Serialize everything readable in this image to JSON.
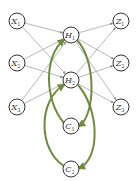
{
  "diagram": {
    "type": "neural-network-with-context-loops",
    "nodes": [
      {
        "id": "X1",
        "label": "X",
        "sub": "1",
        "x": 17,
        "y": 21
      },
      {
        "id": "X2",
        "label": "X",
        "sub": "2",
        "x": 17,
        "y": 63
      },
      {
        "id": "X3",
        "label": "X",
        "sub": "3",
        "x": 17,
        "y": 107
      },
      {
        "id": "H1",
        "label": "H",
        "sub": "1",
        "x": 71,
        "y": 35
      },
      {
        "id": "H2",
        "label": "H",
        "sub": "2",
        "x": 71,
        "y": 80
      },
      {
        "id": "Z1",
        "label": "Z",
        "sub": "1",
        "x": 121,
        "y": 21
      },
      {
        "id": "Z2",
        "label": "Z",
        "sub": "2",
        "x": 121,
        "y": 63
      },
      {
        "id": "Z3",
        "label": "Z",
        "sub": "3",
        "x": 121,
        "y": 107
      },
      {
        "id": "C1",
        "label": "C",
        "sub": "1",
        "x": 71,
        "y": 126
      },
      {
        "id": "C2",
        "label": "C",
        "sub": "2",
        "x": 71,
        "y": 169
      }
    ],
    "edges": [
      [
        "X1",
        "H1"
      ],
      [
        "X1",
        "H2"
      ],
      [
        "X2",
        "H1"
      ],
      [
        "X2",
        "H2"
      ],
      [
        "X3",
        "H1"
      ],
      [
        "X3",
        "H2"
      ],
      [
        "H1",
        "Z1"
      ],
      [
        "H1",
        "Z2"
      ],
      [
        "H1",
        "Z3"
      ],
      [
        "H2",
        "Z1"
      ],
      [
        "H2",
        "Z2"
      ],
      [
        "H2",
        "Z3"
      ]
    ],
    "context_loops": [
      {
        "from": "H1",
        "to": "C1",
        "back_to": "H1"
      },
      {
        "from": "H2",
        "to": "C2",
        "back_to": "H2"
      }
    ],
    "colors": {
      "node_stroke": "#333333",
      "edge": "#888888",
      "loop": "#6f8a3e"
    }
  }
}
